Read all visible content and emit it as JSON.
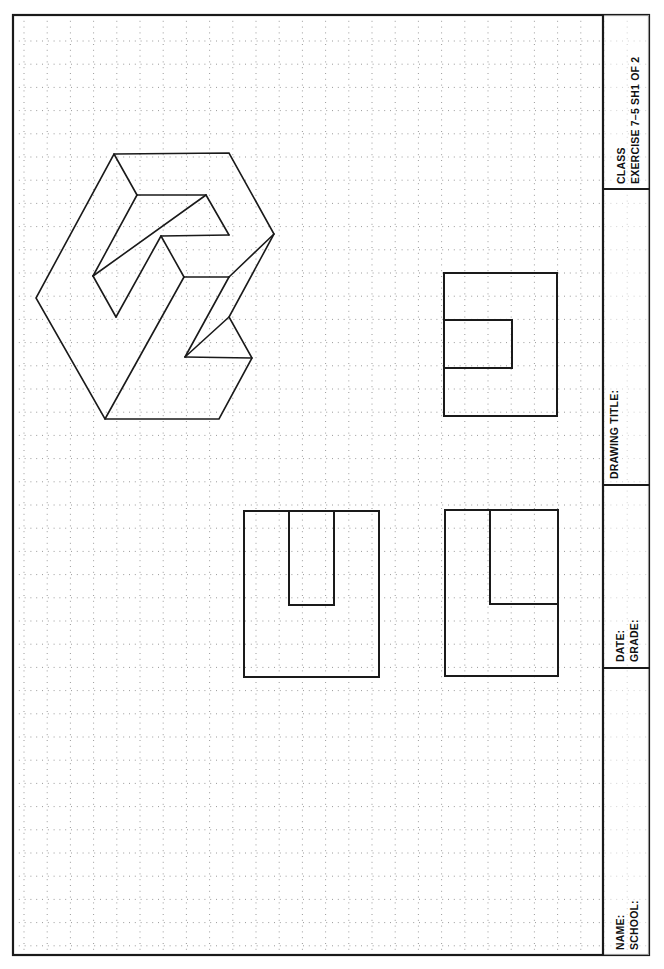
{
  "sheet": {
    "border": {
      "x": 13,
      "y": 15,
      "w": 636,
      "h": 940,
      "stroke": "#1a1a1a",
      "width": 2.2
    },
    "grid": {
      "spacing": 23.2,
      "origin_x": 24,
      "origin_y": 41,
      "dot_color": "#9a9a9a"
    },
    "ink_color": "#1a1a1a"
  },
  "title_block": {
    "x_left": 603,
    "dividers_y": [
      189,
      485,
      668
    ],
    "class_label": "CLASS",
    "exercise_label": "EXERCISE  7–5  SH1  OF  2",
    "drawing_title_label": "DRAWING  TITLE:",
    "date_label": "DATE:",
    "grade_label": "GRADE:",
    "name_label": "NAME:",
    "school_label": "SCHOOL:"
  },
  "isometric_view": {
    "outline": [
      [
        114,
        154
      ],
      [
        229,
        153
      ],
      [
        274,
        234
      ],
      [
        229,
        317
      ],
      [
        252,
        358
      ],
      [
        219,
        419
      ],
      [
        105,
        419
      ],
      [
        36,
        298
      ]
    ],
    "lines": [
      [
        [
          114,
          154
        ],
        [
          137,
          195
        ]
      ],
      [
        [
          137,
          195
        ],
        [
          206,
          195
        ]
      ],
      [
        [
          206,
          195
        ],
        [
          229,
          235
        ]
      ],
      [
        [
          229,
          235
        ],
        [
          161,
          236
        ]
      ],
      [
        [
          137,
          195
        ],
        [
          93,
          276
        ]
      ],
      [
        [
          93,
          276
        ],
        [
          206,
          195
        ]
      ],
      [
        [
          93,
          276
        ],
        [
          116,
          317
        ]
      ],
      [
        [
          116,
          317
        ],
        [
          161,
          236
        ]
      ],
      [
        [
          161,
          236
        ],
        [
          184,
          277
        ]
      ],
      [
        [
          184,
          277
        ],
        [
          229,
          277
        ]
      ],
      [
        [
          274,
          234
        ],
        [
          229,
          277
        ]
      ],
      [
        [
          184,
          277
        ],
        [
          105,
          419
        ]
      ],
      [
        [
          229,
          277
        ],
        [
          185,
          357
        ]
      ],
      [
        [
          185,
          357
        ],
        [
          229,
          317
        ]
      ],
      [
        [
          185,
          357
        ],
        [
          252,
          358
        ]
      ]
    ]
  },
  "orthographic_views": {
    "front_view": {
      "x": 244,
      "y": 511,
      "w": 135,
      "h": 166,
      "slot": {
        "x": 289,
        "y": 511,
        "w": 45,
        "h": 94
      }
    },
    "side_view": {
      "x": 445,
      "y": 510,
      "w": 113,
      "h": 166,
      "notch": {
        "x": 490,
        "y": 510,
        "w": 68,
        "h": 94
      }
    },
    "top_view": {
      "x": 444,
      "y": 273,
      "w": 113,
      "h": 143,
      "inner_rect": {
        "x": 444,
        "y": 320,
        "w": 68,
        "h": 48
      }
    }
  }
}
